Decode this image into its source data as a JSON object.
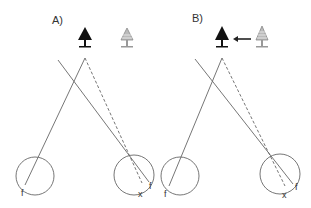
{
  "panels": [
    {
      "label": "A)",
      "eye_left_label": "f",
      "eye_right_label_f": "f",
      "eye_right_label_x": "x",
      "tree_dark": "dark-tree-icon",
      "tree_light": "light-tree-icon",
      "arrow": null
    },
    {
      "label": "B)",
      "eye_left_label": "f",
      "eye_right_label_f": "f",
      "eye_right_label_x": "x",
      "tree_dark": "dark-tree-icon",
      "tree_light": "light-tree-icon",
      "arrow": "left-arrow-icon"
    }
  ],
  "colors": {
    "line": "#666666",
    "tree_dark": "#111111",
    "tree_light": "#a0a0a0",
    "text": "#333333"
  }
}
